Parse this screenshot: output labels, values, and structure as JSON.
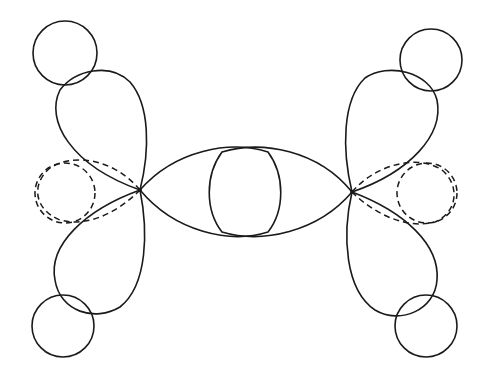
{
  "diagram": {
    "type": "orbital-lobe-diagram",
    "nodes": [
      {
        "id": "left-center",
        "x": 140,
        "y": 190
      },
      {
        "id": "right-center",
        "x": 352,
        "y": 192
      }
    ],
    "line_color": "#1a1a1a",
    "background": "#ffffff"
  }
}
